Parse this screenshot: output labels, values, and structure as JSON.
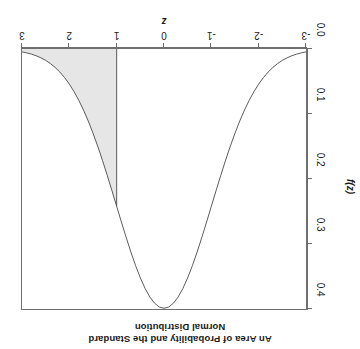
{
  "chart_data": {
    "type": "area",
    "title": "An Area of Probability and the Standard Normal Distribution",
    "title_lines": [
      "An Area of Probability and the Standard",
      "Normal Distribution"
    ],
    "xlabel": "z",
    "ylabel": "f(z)",
    "xlim": [
      -3,
      3
    ],
    "ylim": [
      0.0,
      0.4
    ],
    "xticks": [
      -3,
      -2,
      -1,
      0,
      1,
      2,
      3
    ],
    "xtick_labels": [
      "-3",
      "-2",
      "-1",
      "0",
      "1",
      "2",
      "3"
    ],
    "yticks": [
      0.0,
      0.1,
      0.2,
      0.3,
      0.4
    ],
    "ytick_labels": [
      "0.0",
      "0.1",
      "0.2",
      "0.3",
      "0.4"
    ],
    "grid": false,
    "legend": null,
    "rotation_degrees": 180,
    "curve_color": "#4a4a4a",
    "shade_color": "#e6e6e6",
    "shade_edge_color": "#4a4a4a",
    "frame_color": "#6f6f6f",
    "shaded_region": {
      "label": "right tail",
      "from": 1,
      "to": 3,
      "area": 0.1587
    },
    "x": [
      -3.0,
      -2.9,
      -2.8,
      -2.7,
      -2.6,
      -2.5,
      -2.4,
      -2.3,
      -2.2,
      -2.1,
      -2.0,
      -1.9,
      -1.8,
      -1.7,
      -1.6,
      -1.5,
      -1.4,
      -1.3,
      -1.2,
      -1.1,
      -1.0,
      -0.9,
      -0.8,
      -0.7,
      -0.6,
      -0.5,
      -0.4,
      -0.3,
      -0.2,
      -0.1,
      0.0,
      0.1,
      0.2,
      0.3,
      0.4,
      0.5,
      0.6,
      0.7,
      0.8,
      0.9,
      1.0,
      1.1,
      1.2,
      1.3,
      1.4,
      1.5,
      1.6,
      1.7,
      1.8,
      1.9,
      2.0,
      2.1,
      2.2,
      2.3,
      2.4,
      2.5,
      2.6,
      2.7,
      2.8,
      2.9,
      3.0
    ],
    "y": [
      0.0044,
      0.006,
      0.0079,
      0.0104,
      0.0136,
      0.0175,
      0.0224,
      0.0283,
      0.0355,
      0.044,
      0.054,
      0.0656,
      0.079,
      0.094,
      0.1109,
      0.1295,
      0.1497,
      0.1714,
      0.1942,
      0.2179,
      0.242,
      0.2661,
      0.2897,
      0.3123,
      0.3332,
      0.3521,
      0.3683,
      0.3814,
      0.391,
      0.397,
      0.3989,
      0.397,
      0.391,
      0.3814,
      0.3683,
      0.3521,
      0.3332,
      0.3123,
      0.2897,
      0.2661,
      0.242,
      0.2179,
      0.1942,
      0.1714,
      0.1497,
      0.1295,
      0.1109,
      0.094,
      0.079,
      0.0656,
      0.054,
      0.044,
      0.0355,
      0.0283,
      0.0224,
      0.0175,
      0.0136,
      0.0104,
      0.0079,
      0.006,
      0.0044
    ]
  }
}
